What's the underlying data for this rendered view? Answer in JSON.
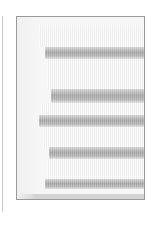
{
  "image": {
    "description": "Grayscale photo of stacked horizontal cylindrical tubes inside a rectangular frame",
    "colors": {
      "background": "#ffffff",
      "frame_border": "#9a9a9a",
      "light_band": "#f6f6f6",
      "dark_band": "#a9a9a9"
    },
    "bands": [
      {
        "type": "light",
        "top": 8,
        "height": 22,
        "left": 22
      },
      {
        "type": "dark",
        "top": 30,
        "height": 12,
        "left": 28
      },
      {
        "type": "light",
        "top": 42,
        "height": 30,
        "left": 30
      },
      {
        "type": "dark",
        "top": 72,
        "height": 14,
        "left": 34
      },
      {
        "type": "light",
        "top": 86,
        "height": 12,
        "left": 24
      },
      {
        "type": "dark",
        "top": 98,
        "height": 12,
        "left": 22
      },
      {
        "type": "light",
        "top": 110,
        "height": 20,
        "left": 26
      },
      {
        "type": "dark",
        "top": 130,
        "height": 12,
        "left": 32
      },
      {
        "type": "light",
        "top": 142,
        "height": 20,
        "left": 30
      },
      {
        "type": "dark",
        "top": 162,
        "height": 10,
        "left": 28
      }
    ]
  }
}
